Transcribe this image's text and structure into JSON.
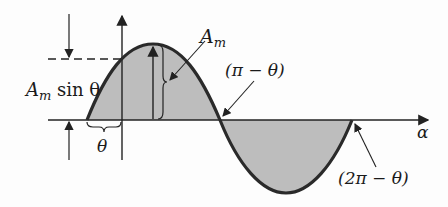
{
  "diagram": {
    "type": "phase-shifted sine wave",
    "labels": {
      "amplitude": "A",
      "amplitude_sub": "m",
      "amp_sin_prefix": "A",
      "amp_sin_sub": "m",
      "amp_sin_suffix": " sin θ",
      "theta": "θ",
      "pi_minus_theta": "(π − θ)",
      "two_pi_minus_theta": "(2π − θ)",
      "x_axis": "α"
    },
    "colors": {
      "curve": "#2a2a2a",
      "fill": "#bdbdbd",
      "axis": "#222222"
    }
  }
}
